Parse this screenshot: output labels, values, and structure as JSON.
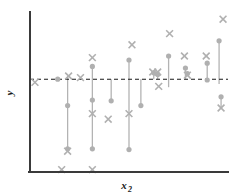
{
  "chart_data": {
    "type": "scatter",
    "title": "",
    "subtitle": "",
    "xlabel": "x",
    "xlabel_sub": "2",
    "ylabel": "y",
    "ylabel_sub": "",
    "grid": false,
    "legend": "none",
    "xlim": [
      0,
      100
    ],
    "ylim": [
      0,
      100
    ],
    "reference_line": {
      "orientation": "horizontal",
      "y": 58,
      "style": "dashed",
      "label": ""
    },
    "axis_style": {
      "left_spine": true,
      "bottom_spine": true,
      "top_spine": false,
      "right_spine": false,
      "ticks": "none",
      "tick_labels": "none"
    },
    "series": [
      {
        "name": "fitted",
        "marker": "circle",
        "color": "#b0b0b0",
        "points": [
          {
            "x": 14.0,
            "y": 58.0
          },
          {
            "x": 19.0,
            "y": 41.5
          },
          {
            "x": 19.0,
            "y": 14.5
          },
          {
            "x": 31.5,
            "y": 14.5
          },
          {
            "x": 31.5,
            "y": 45.0
          },
          {
            "x": 31.5,
            "y": 66.0
          },
          {
            "x": 41.0,
            "y": 44.5
          },
          {
            "x": 50.0,
            "y": 14.0
          },
          {
            "x": 50.0,
            "y": 70.0
          },
          {
            "x": 56.0,
            "y": 41.5
          },
          {
            "x": 62.5,
            "y": 62.0
          },
          {
            "x": 64.5,
            "y": 61.0
          },
          {
            "x": 70.0,
            "y": 72.5
          },
          {
            "x": 78.5,
            "y": 65.0
          },
          {
            "x": 79.5,
            "y": 61.5
          },
          {
            "x": 89.5,
            "y": 57.5
          },
          {
            "x": 89.5,
            "y": 68.0
          },
          {
            "x": 95.5,
            "y": 82.0
          },
          {
            "x": 96.5,
            "y": 47.0
          }
        ]
      },
      {
        "name": "observed",
        "marker": "x",
        "color": "#b0b0b0",
        "points": [
          {
            "x": 2.5,
            "y": 56.0
          },
          {
            "x": 16.0,
            "y": 1.5
          },
          {
            "x": 19.0,
            "y": 13.0
          },
          {
            "x": 19.5,
            "y": 60.0
          },
          {
            "x": 25.5,
            "y": 59.0
          },
          {
            "x": 31.5,
            "y": 1.5
          },
          {
            "x": 31.5,
            "y": 36.5
          },
          {
            "x": 31.5,
            "y": 71.5
          },
          {
            "x": 39.5,
            "y": 33.0
          },
          {
            "x": 50.0,
            "y": 36.5
          },
          {
            "x": 51.5,
            "y": 79.5
          },
          {
            "x": 62.0,
            "y": 62.5
          },
          {
            "x": 64.5,
            "y": 62.5
          },
          {
            "x": 65.0,
            "y": 53.5
          },
          {
            "x": 70.5,
            "y": 86.5
          },
          {
            "x": 78.0,
            "y": 72.5
          },
          {
            "x": 79.5,
            "y": 60.5
          },
          {
            "x": 89.0,
            "y": 72.5
          },
          {
            "x": 96.5,
            "y": 40.0
          },
          {
            "x": 97.5,
            "y": 95.5
          }
        ]
      }
    ],
    "stems": [
      {
        "x": 19.0,
        "y0": 14.5,
        "y1": 60.0
      },
      {
        "x": 31.5,
        "y0": 14.5,
        "y1": 66.0
      },
      {
        "x": 41.0,
        "y0": 44.5,
        "y1": 58.0
      },
      {
        "x": 50.0,
        "y0": 14.0,
        "y1": 70.0
      },
      {
        "x": 56.0,
        "y0": 41.5,
        "y1": 58.0
      },
      {
        "x": 62.5,
        "y0": 58.0,
        "y1": 62.0
      },
      {
        "x": 64.5,
        "y0": 58.0,
        "y1": 61.0
      },
      {
        "x": 70.0,
        "y0": 53.0,
        "y1": 72.5
      },
      {
        "x": 78.5,
        "y0": 58.0,
        "y1": 65.0
      },
      {
        "x": 89.5,
        "y0": 57.5,
        "y1": 68.0
      },
      {
        "x": 95.5,
        "y0": 55.0,
        "y1": 82.0
      },
      {
        "x": 96.5,
        "y0": 40.0,
        "y1": 47.0
      }
    ]
  }
}
